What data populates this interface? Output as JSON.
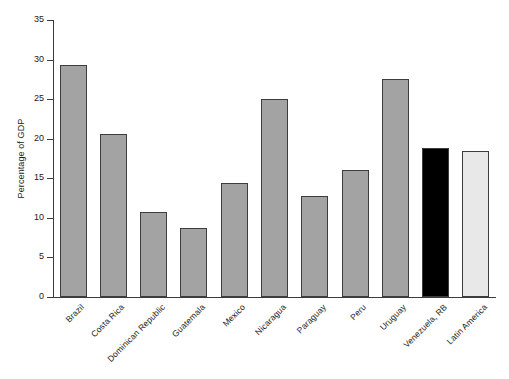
{
  "chart_data": {
    "type": "bar",
    "title": "",
    "xlabel": "",
    "ylabel": "Percentage of GDP",
    "ylim": [
      0,
      35
    ],
    "ytick_labels": [
      "0",
      "5",
      "10",
      "15",
      "20",
      "25",
      "30",
      "35"
    ],
    "ytick_values": [
      0,
      5,
      10,
      15,
      20,
      25,
      30,
      35
    ],
    "grid": false,
    "legend": "none",
    "categories": [
      "Brazil",
      "Costa Rica",
      "Dominican Republic",
      "Guatemala",
      "Mexico",
      "Nicaragua",
      "Paraguay",
      "Peru",
      "Uruguay",
      "Venezuela, RB",
      "Latin America"
    ],
    "values": [
      29.3,
      20.6,
      10.7,
      8.7,
      14.4,
      25.0,
      12.8,
      16.1,
      27.6,
      18.8,
      18.5
    ],
    "bar_colors": [
      "#a3a3a3",
      "#a3a3a3",
      "#a3a3a3",
      "#a3a3a3",
      "#a3a3a3",
      "#a3a3a3",
      "#a3a3a3",
      "#a3a3a3",
      "#a3a3a3",
      "#000000",
      "#e8e8e8"
    ],
    "bar_edge_color": "#3d3d3d",
    "axis_color": "#3c3c3c",
    "background_color": "#ffffff",
    "label_rotation_degrees": -45
  }
}
